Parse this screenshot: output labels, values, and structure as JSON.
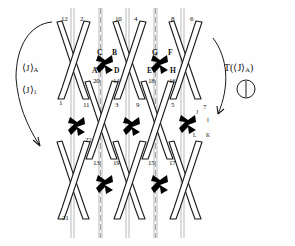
{
  "figure": {
    "type": "braid-weave-lattice-diagram",
    "background": "#ffffff",
    "ink": "#111111",
    "crossing_marker_color": "#000000",
    "strand_count": 12
  },
  "annotations": {
    "left_upper": {
      "bracket_open": "⟨",
      "symbol": "J",
      "bracket_close": "⟩",
      "subscript": "A"
    },
    "left_lower": {
      "bracket_open": "⟨",
      "symbol": "J",
      "bracket_close": "⟩",
      "subscript": "1"
    },
    "right": {
      "prefix": "T(",
      "bracket_open": "⟨",
      "symbol": "J",
      "bracket_close": "⟩",
      "subscript": "A",
      "suffix": ")"
    },
    "right_glyph_name": "circle-with-vertical-bar"
  },
  "labels": {
    "top_row": [
      {
        "text": "12",
        "x": 61,
        "y": 16
      },
      {
        "text": "2",
        "x": 80,
        "y": 16
      },
      {
        "text": "10",
        "x": 115,
        "y": 16
      },
      {
        "text": "4",
        "x": 134,
        "y": 16
      },
      {
        "text": "8",
        "x": 171,
        "y": 16
      },
      {
        "text": "6",
        "x": 190,
        "y": 16
      }
    ],
    "letters_upper_left": [
      {
        "text": "C",
        "x": 97,
        "y": 49
      },
      {
        "text": "B",
        "x": 112,
        "y": 49
      },
      {
        "text": "A",
        "x": 92,
        "y": 67
      },
      {
        "text": "D",
        "x": 114,
        "y": 67
      }
    ],
    "letters_upper_right": [
      {
        "text": "G",
        "x": 152,
        "y": 49
      },
      {
        "text": "F",
        "x": 168,
        "y": 49
      },
      {
        "text": "E",
        "x": 147,
        "y": 67
      },
      {
        "text": "H",
        "x": 170,
        "y": 67
      }
    ],
    "letters_mid_right": [
      {
        "text": "J",
        "x": 196,
        "y": 110
      },
      {
        "text": "I",
        "x": 207,
        "y": 118
      },
      {
        "text": "L",
        "x": 193,
        "y": 133
      },
      {
        "text": "K",
        "x": 206,
        "y": 133
      }
    ],
    "second_row": [
      {
        "text": "20",
        "x": 93,
        "y": 78
      },
      {
        "text": "14",
        "x": 113,
        "y": 78
      },
      {
        "text": "18",
        "x": 148,
        "y": 78
      },
      {
        "text": "16",
        "x": 169,
        "y": 78
      }
    ],
    "third_row": [
      {
        "text": "1",
        "x": 59,
        "y": 100
      },
      {
        "text": "11",
        "x": 83,
        "y": 102
      },
      {
        "text": "3",
        "x": 115,
        "y": 102
      },
      {
        "text": "9",
        "x": 136,
        "y": 102
      },
      {
        "text": "5",
        "x": 171,
        "y": 102
      },
      {
        "text": "7",
        "x": 203,
        "y": 104
      }
    ],
    "fourth_row": [
      {
        "text": "22",
        "x": 85,
        "y": 137
      }
    ],
    "fifth_row": [
      {
        "text": "13",
        "x": 93,
        "y": 160
      },
      {
        "text": "19",
        "x": 113,
        "y": 160
      },
      {
        "text": "15",
        "x": 148,
        "y": 160
      },
      {
        "text": "17",
        "x": 169,
        "y": 160
      }
    ],
    "bottom_row": [
      {
        "text": "21",
        "x": 62,
        "y": 215
      }
    ]
  },
  "crossing_markers": [
    {
      "name": "crossing-x-1",
      "x": 105,
      "y": 62,
      "size": 15
    },
    {
      "name": "crossing-x-2",
      "x": 160,
      "y": 62,
      "size": 15
    },
    {
      "name": "crossing-x-3",
      "x": 77,
      "y": 124,
      "size": 15
    },
    {
      "name": "crossing-x-4",
      "x": 132,
      "y": 124,
      "size": 15
    },
    {
      "name": "crossing-x-5",
      "x": 188,
      "y": 122,
      "size": 15
    },
    {
      "name": "crossing-x-6",
      "x": 105,
      "y": 182,
      "size": 15
    },
    {
      "name": "crossing-x-7",
      "x": 160,
      "y": 182,
      "size": 15
    }
  ]
}
